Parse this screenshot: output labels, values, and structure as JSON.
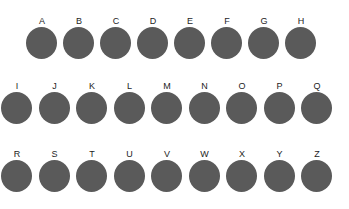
{
  "canvas": {
    "width": 349,
    "height": 209,
    "background_color": "#ffffff"
  },
  "style": {
    "dot_color": "#5a5a5a",
    "label_color": "#1d1d1d",
    "dot_width": 31,
    "dot_height": 32,
    "label_font_size": 9
  },
  "rows": [
    {
      "name": "row-1",
      "label_top": 15,
      "dot_top": 27,
      "start_x": 26,
      "pitch": 37,
      "items": [
        {
          "label": "A"
        },
        {
          "label": "B"
        },
        {
          "label": "C"
        },
        {
          "label": "D"
        },
        {
          "label": "E"
        },
        {
          "label": "F"
        },
        {
          "label": "G"
        },
        {
          "label": "H"
        }
      ]
    },
    {
      "name": "row-2",
      "label_top": 80,
      "dot_top": 92,
      "start_x": 1,
      "pitch": 37.5,
      "items": [
        {
          "label": "I"
        },
        {
          "label": "J"
        },
        {
          "label": "K"
        },
        {
          "label": "L"
        },
        {
          "label": "M"
        },
        {
          "label": "N"
        },
        {
          "label": "O"
        },
        {
          "label": "P"
        },
        {
          "label": "Q"
        }
      ]
    },
    {
      "name": "row-3",
      "label_top": 148,
      "dot_top": 160,
      "start_x": 1,
      "pitch": 37.5,
      "items": [
        {
          "label": "R"
        },
        {
          "label": "S"
        },
        {
          "label": "T"
        },
        {
          "label": "U"
        },
        {
          "label": "V"
        },
        {
          "label": "W"
        },
        {
          "label": "X"
        },
        {
          "label": "Y"
        },
        {
          "label": "Z"
        }
      ]
    }
  ]
}
